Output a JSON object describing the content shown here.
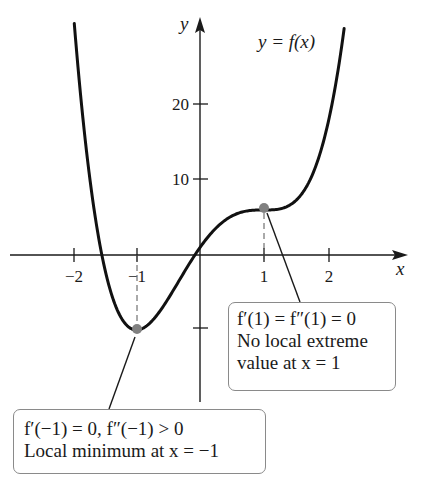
{
  "chart_data": {
    "type": "line",
    "title": "",
    "function_label": "y = f(x)",
    "function": "f(x) = 3x^4 - 4x^3 - 6x^2 + 12x + 1",
    "xlabel": "x",
    "ylabel": "y",
    "x_ticks": [
      -2,
      -1,
      1,
      2
    ],
    "x_tick_labels": [
      "−2",
      "−1",
      "1",
      "2"
    ],
    "y_ticks": [
      20,
      10,
      -10
    ],
    "y_tick_labels": [
      "20",
      "10",
      ""
    ],
    "xlim": [
      -3.1,
      3.2
    ],
    "ylim": [
      -20,
      31
    ],
    "grid": false,
    "points": [
      {
        "x": -1,
        "y": -10,
        "label": "local minimum"
      },
      {
        "x": 1,
        "y": 6,
        "label": "no local extreme"
      }
    ],
    "series": [
      {
        "name": "f(x)",
        "x": [
          -1.98,
          -1.8,
          -1.6,
          -1.4,
          -1.2,
          -1.0,
          -0.8,
          -0.6,
          -0.4,
          -0.2,
          0.0,
          0.2,
          0.4,
          0.6,
          0.8,
          1.0,
          1.2,
          1.4,
          1.6,
          1.8,
          2.0,
          2.27
        ],
        "values": [
          30.6,
          17.2,
          7.5,
          0.9,
          -3.2,
          -10.0,
          -8.4,
          -6.0,
          -3.5,
          -1.3,
          1.0,
          3.1,
          4.8,
          5.7,
          6.0,
          6.0,
          6.1,
          7.1,
          9.8,
          15.0,
          25.0,
          30.0
        ]
      }
    ],
    "annotations": [
      {
        "lines": [
          "f′(1) = f″(1) = 0",
          "No local extreme",
          "value at x = 1"
        ]
      },
      {
        "lines": [
          "f′(−1) = 0, f″(−1) > 0",
          "Local minimum at x = −1"
        ]
      }
    ]
  },
  "axes": {
    "x_label": "x",
    "y_label": "y",
    "x_ticks": [
      {
        "value": -2,
        "label": "−2"
      },
      {
        "value": -1,
        "label": "−1"
      },
      {
        "value": 1,
        "label": "1"
      },
      {
        "value": 2,
        "label": "2"
      }
    ],
    "y_ticks": [
      {
        "value": 20,
        "label": "20"
      },
      {
        "value": 10,
        "label": "10"
      },
      {
        "value": -10,
        "label": ""
      }
    ]
  },
  "curve_label": "y = f(x)",
  "callouts": {
    "inflection": {
      "line1": "f′(1) = f″(1) = 0",
      "line2": "No local extreme",
      "line3": "value at x = 1"
    },
    "minimum": {
      "line1": "f′(−1) = 0, f″(−1) > 0",
      "line2": "Local minimum at x = −1"
    }
  },
  "colors": {
    "curve": "#111111",
    "axis": "#1a1a1a",
    "point": "#808080",
    "callout_border": "#8a8a8a"
  }
}
